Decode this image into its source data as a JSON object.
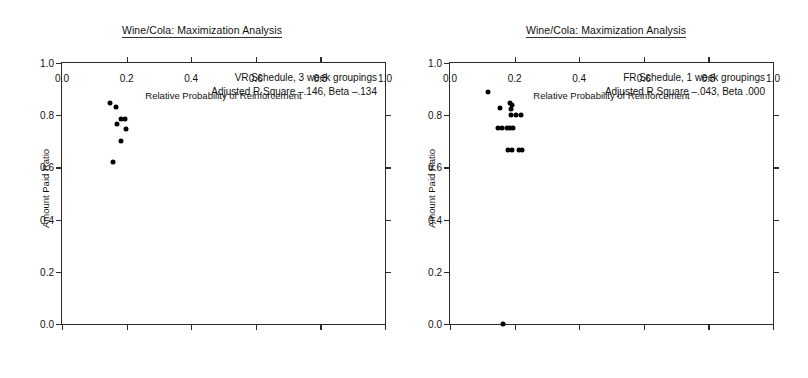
{
  "figure": {
    "width": 808,
    "height": 378,
    "background": "#ffffff",
    "point_color": "#000000",
    "axis_color": "#2b2b2b"
  },
  "chart_data": [
    {
      "type": "scatter",
      "panel": "left",
      "title": "Wine/Cola: Maximization Analysis",
      "xlabel": "Relative Probability of Reinforcement",
      "ylabel": "Amount Paid Ratio",
      "xlim": [
        0.0,
        1.0
      ],
      "ylim": [
        0.0,
        1.0
      ],
      "xticks": [
        0.0,
        0.2,
        0.4,
        0.6,
        0.8,
        1.0
      ],
      "yticks": [
        0.0,
        0.2,
        0.4,
        0.6,
        0.8,
        1.0
      ],
      "xticklabels": [
        "0.0",
        "0.2",
        "0.4",
        "0.6",
        "0.8",
        "1.0"
      ],
      "yticklabels": [
        "0.0",
        "0.2",
        "0.4",
        "0.6",
        "0.8",
        "1.0"
      ],
      "grid": false,
      "legend": "none",
      "annotation_lines": [
        "VR Schedule, 3 week groupings",
        "Adjusted R Square –.146, Beta –.134"
      ],
      "annotation_stats": {
        "schedule": "VR Schedule",
        "grouping": "3 week groupings",
        "adjusted_r_square": "-.146",
        "beta": "-.134"
      },
      "points": [
        {
          "x": 0.148,
          "y": 0.847
        },
        {
          "x": 0.166,
          "y": 0.833
        },
        {
          "x": 0.182,
          "y": 0.784
        },
        {
          "x": 0.194,
          "y": 0.784
        },
        {
          "x": 0.171,
          "y": 0.768
        },
        {
          "x": 0.199,
          "y": 0.748
        },
        {
          "x": 0.184,
          "y": 0.7
        },
        {
          "x": 0.158,
          "y": 0.622
        }
      ]
    },
    {
      "type": "scatter",
      "panel": "right",
      "title": "Wine/Cola: Maximization Analysis",
      "xlabel": "Relative Probability of Reinforcement",
      "ylabel": "Amount Paid Ratio",
      "xlim": [
        0.0,
        1.0
      ],
      "ylim": [
        0.0,
        1.0
      ],
      "xticks": [
        0.0,
        0.2,
        0.4,
        0.6,
        0.8,
        1.0
      ],
      "yticks": [
        0.0,
        0.2,
        0.4,
        0.6,
        0.8,
        1.0
      ],
      "xticklabels": [
        "0.0",
        "0.2",
        "0.4",
        "0.6",
        "0.8",
        "1.0"
      ],
      "yticklabels": [
        "0.0",
        "0.2",
        "0.4",
        "0.6",
        "0.8",
        "1.0"
      ],
      "grid": false,
      "legend": "none",
      "annotation_lines": [
        "FR Schedule, 1 week groupings",
        "Adjusted R Square –.043, Beta .000"
      ],
      "annotation_stats": {
        "schedule": "FR Schedule",
        "grouping": "1 week groupings",
        "adjusted_r_square": "-.043",
        "beta": ".000"
      },
      "points": [
        {
          "x": 0.118,
          "y": 0.888
        },
        {
          "x": 0.186,
          "y": 0.848
        },
        {
          "x": 0.192,
          "y": 0.84
        },
        {
          "x": 0.155,
          "y": 0.826
        },
        {
          "x": 0.188,
          "y": 0.822
        },
        {
          "x": 0.188,
          "y": 0.8
        },
        {
          "x": 0.203,
          "y": 0.8
        },
        {
          "x": 0.221,
          "y": 0.8
        },
        {
          "x": 0.15,
          "y": 0.75
        },
        {
          "x": 0.161,
          "y": 0.75
        },
        {
          "x": 0.175,
          "y": 0.75
        },
        {
          "x": 0.186,
          "y": 0.75
        },
        {
          "x": 0.194,
          "y": 0.75
        },
        {
          "x": 0.18,
          "y": 0.666
        },
        {
          "x": 0.192,
          "y": 0.666
        },
        {
          "x": 0.213,
          "y": 0.666
        },
        {
          "x": 0.222,
          "y": 0.666
        },
        {
          "x": 0.165,
          "y": 0.0
        }
      ]
    }
  ]
}
